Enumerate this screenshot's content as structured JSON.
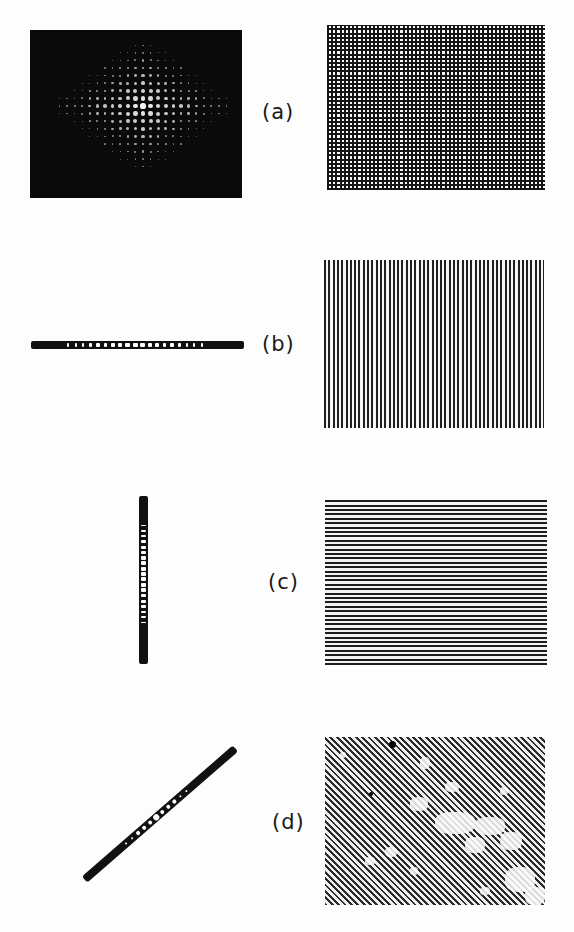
{
  "figure": {
    "rows": [
      {
        "label": "(a)",
        "diffraction": "two-dimensional dot array (crossed grating spectrum)",
        "grating": "crossed grid"
      },
      {
        "label": "(b)",
        "diffraction": "horizontal row of dots",
        "grating": "vertical lines"
      },
      {
        "label": "(c)",
        "diffraction": "vertical column of dots",
        "grating": "horizontal lines"
      },
      {
        "label": "(d)",
        "diffraction": "diagonal row of dots",
        "grating": "diagonal lines"
      }
    ]
  },
  "colors": {
    "background": "#fdfdfd",
    "ink": "#111111",
    "highlight": "#f4f4f4"
  }
}
